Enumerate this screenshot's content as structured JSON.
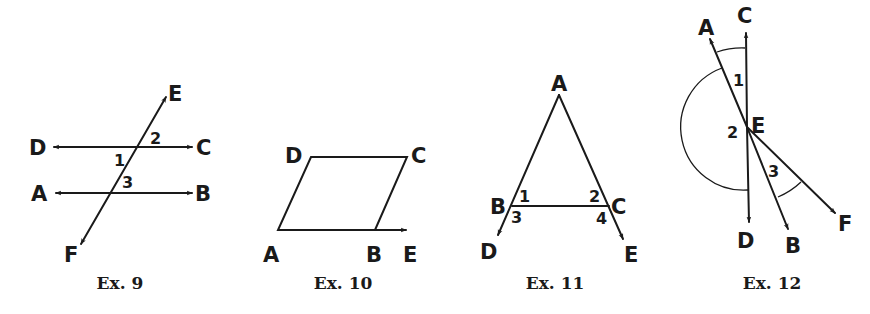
{
  "figures": [
    {
      "caption": "Ex. 9",
      "points": {
        "D": "D",
        "C": "C",
        "A": "A",
        "B": "B",
        "E": "E",
        "F": "F"
      },
      "angles": [
        "1",
        "2",
        "3"
      ],
      "description": "Two parallel lines DC and AB cut by transversal FE"
    },
    {
      "caption": "Ex. 10",
      "points": {
        "A": "A",
        "B": "B",
        "C": "C",
        "D": "D",
        "E": "E"
      },
      "description": "Parallelogram ABCD with ray AB extended to E"
    },
    {
      "caption": "Ex. 11",
      "points": {
        "A": "A",
        "B": "B",
        "C": "C",
        "D": "D",
        "E": "E"
      },
      "angles": [
        "1",
        "2",
        "3",
        "4"
      ],
      "description": "Triangle ABC with sides AB extended to D and AC extended to E"
    },
    {
      "caption": "Ex. 12",
      "points": {
        "A": "A",
        "C": "C",
        "E": "E",
        "D": "D",
        "B": "B",
        "F": "F"
      },
      "angles": [
        "1",
        "2",
        "3"
      ],
      "description": "Rays EA, EC, ED, EB, EF from common point E with marked angles"
    }
  ],
  "colors": {
    "ink": "#1a1a1a",
    "background": "#ffffff"
  }
}
